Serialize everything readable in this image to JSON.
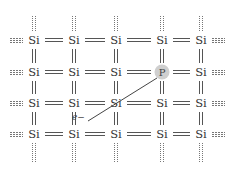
{
  "diagram": {
    "title": "",
    "lattice": {
      "columns_x": [
        34,
        74,
        116,
        162,
        201
      ],
      "rows_y": [
        40,
        72,
        103,
        134
      ],
      "atoms": [
        [
          "Si",
          "Si",
          "Si",
          "Si",
          "Si"
        ],
        [
          "Si",
          "Si",
          "Si",
          "P",
          "Si"
        ],
        [
          "Si",
          "Si",
          "Si",
          "Si",
          "Si"
        ],
        [
          "Si",
          "Si",
          "Si",
          "Si",
          "Si"
        ]
      ],
      "dopant": {
        "symbol": "P",
        "row": 1,
        "col": 3,
        "fill": "#cfcfcf"
      },
      "bond_type": "double",
      "edge_bond_style": "dotted"
    },
    "free_electron": {
      "label": "e−",
      "label_pos": [
        72,
        112
      ],
      "path_from": [
        157,
        78
      ],
      "path_to": [
        88,
        121
      ]
    },
    "colors": {
      "bond": "#555555",
      "text": "#333333",
      "dopant_fill": "#cfcfcf"
    }
  }
}
